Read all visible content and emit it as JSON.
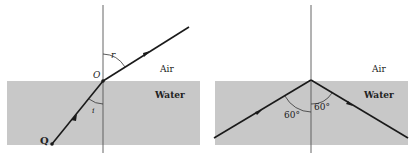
{
  "colors": {
    "water": "#c8c8c8",
    "line": "#1a1a1a",
    "normal": "#555555",
    "background": "#ffffff"
  },
  "left_panel": {
    "medium_upper": "Air",
    "medium_lower": "Water",
    "point_origin": "O",
    "point_source": "Q",
    "angle_incidence": "i",
    "angle_refraction": "r"
  },
  "right_panel": {
    "medium_upper": "Air",
    "medium_lower": "Water",
    "angle_left": "60°",
    "angle_right": "60°"
  }
}
